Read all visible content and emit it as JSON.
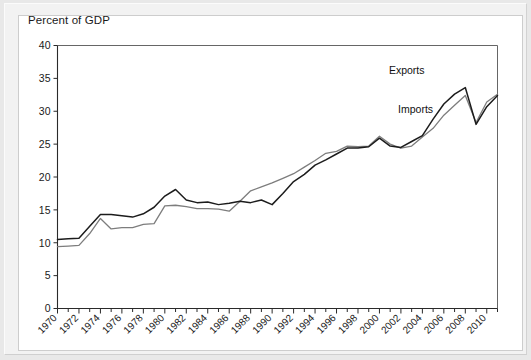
{
  "window": {
    "background_color": "#e8e8e8",
    "panel_color": "#ffffff",
    "frame_color": "#f2f2f2"
  },
  "chart_data": {
    "type": "line",
    "title": "Percent of GDP",
    "xlabel": "",
    "ylabel": "Percent of GDP",
    "ylim": [
      0,
      40
    ],
    "xlim": [
      1970,
      2011
    ],
    "ytick_labels": [
      "0",
      "5",
      "10",
      "15",
      "20",
      "25",
      "30",
      "35",
      "40"
    ],
    "ytick_values": [
      0,
      5,
      10,
      15,
      20,
      25,
      30,
      35,
      40
    ],
    "xtick_labels": [
      "1970",
      "1972",
      "1974",
      "1976",
      "1978",
      "1980",
      "1982",
      "1984",
      "1986",
      "1988",
      "1990",
      "1992",
      "1994",
      "1996",
      "1998",
      "2000",
      "2002",
      "2004",
      "2006",
      "2008",
      "2010"
    ],
    "xtick_values": [
      1970,
      1972,
      1974,
      1976,
      1978,
      1980,
      1982,
      1984,
      1986,
      1988,
      1990,
      1992,
      1994,
      1996,
      1998,
      2000,
      2002,
      2004,
      2006,
      2008,
      2010
    ],
    "xtick_rotation_deg": 45,
    "minor_xticks_every": 1,
    "grid": false,
    "legend_position": "inline-annotation",
    "x": [
      1970,
      1971,
      1972,
      1973,
      1974,
      1975,
      1976,
      1977,
      1978,
      1979,
      1980,
      1981,
      1982,
      1983,
      1984,
      1985,
      1986,
      1987,
      1988,
      1989,
      1990,
      1991,
      1992,
      1993,
      1994,
      1995,
      1996,
      1997,
      1998,
      1999,
      2000,
      2001,
      2002,
      2003,
      2004,
      2005,
      2006,
      2007,
      2008,
      2009,
      2010,
      2011
    ],
    "series": [
      {
        "name": "Exports",
        "color": "#7d7d7d",
        "line_width": 1.3,
        "label_x": 2004.2,
        "label_y": 35.6,
        "values": [
          9.4,
          9.5,
          9.6,
          11.4,
          13.7,
          12.1,
          12.3,
          12.3,
          12.8,
          12.9,
          15.6,
          15.7,
          15.5,
          15.2,
          15.2,
          15.1,
          14.8,
          16.3,
          17.9,
          18.5,
          19.1,
          19.8,
          20.5,
          21.5,
          22.5,
          23.6,
          23.9,
          24.7,
          24.6,
          24.7,
          26.2,
          25.0,
          24.4,
          24.7,
          26.1,
          27.4,
          29.4,
          30.9,
          32.4,
          28.3,
          31.4,
          32.6
        ]
      },
      {
        "name": "Imports",
        "color": "#1c1c1c",
        "line_width": 1.5,
        "label_x": 2005.0,
        "label_y": 29.7,
        "values": [
          10.5,
          10.6,
          10.7,
          12.5,
          14.3,
          14.3,
          14.1,
          13.9,
          14.4,
          15.4,
          17.1,
          18.1,
          16.5,
          16.1,
          16.2,
          15.8,
          16.0,
          16.3,
          16.1,
          16.5,
          15.8,
          17.5,
          19.3,
          20.4,
          21.8,
          22.6,
          23.5,
          24.4,
          24.4,
          24.6,
          25.9,
          24.7,
          24.5,
          25.4,
          26.3,
          28.8,
          31.1,
          32.6,
          33.6,
          28.0,
          30.7,
          32.4
        ]
      }
    ]
  }
}
